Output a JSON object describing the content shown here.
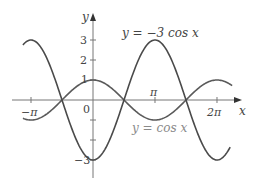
{
  "chart_data": {
    "type": "line",
    "title": "",
    "xlabel": "x",
    "ylabel": "y",
    "xlim": [
      -3.55,
      7.05
    ],
    "ylim": [
      -3.8,
      4.7
    ],
    "grid": false,
    "x_ticks": [
      {
        "value": -3.14159,
        "label": "−π"
      },
      {
        "value": 3.14159,
        "label": "π"
      },
      {
        "value": 6.28318,
        "label": "2π"
      }
    ],
    "y_ticks": [
      {
        "value": 3,
        "label": "3"
      },
      {
        "value": 2,
        "label": "2"
      },
      {
        "value": 1,
        "label": "1"
      },
      {
        "value": -1,
        "label": ""
      },
      {
        "value": -2,
        "label": ""
      },
      {
        "value": -3,
        "label": "−3"
      }
    ],
    "origin_label": "0",
    "series": [
      {
        "name": "y = cos x",
        "function": "cos",
        "amplitude": 1,
        "x_range": [
          -3.55,
          7.05
        ],
        "color": "#5a5a5a",
        "label_color": "#8a8a8a"
      },
      {
        "name": "y = −3 cos x",
        "function": "cos",
        "amplitude": -3,
        "x_range": [
          -3.55,
          6.95
        ],
        "color": "#4a4a4a",
        "label_color": "#333333"
      }
    ],
    "annotations": [
      {
        "text": "y = −3 cos x",
        "series": 1,
        "pos": [
          122,
          37
        ]
      },
      {
        "text": "y = cos x",
        "series": 0,
        "pos": [
          132,
          132
        ]
      }
    ],
    "intersections_at": [
      "−π/2",
      "π/2",
      "3π/2"
    ]
  },
  "labels": {
    "x_axis": "x",
    "y_axis": "y",
    "origin": "0",
    "neg_pi": "−π",
    "pi": "π",
    "two_pi": "2π",
    "y3": "3",
    "y2": "2",
    "y1": "1",
    "yneg3": "−3",
    "eq_neg3cos": "y = −3 cos x",
    "eq_cos": "y = cos x"
  }
}
